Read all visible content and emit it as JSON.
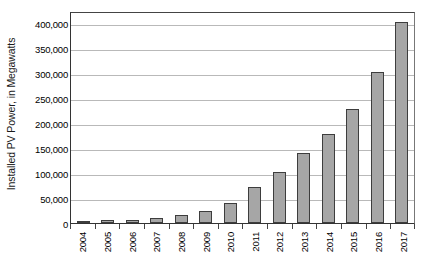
{
  "chart_data": {
    "type": "bar",
    "title": "",
    "xlabel": "",
    "ylabel": "Installed PV Power, in Megawatts",
    "categories": [
      "2004",
      "2005",
      "2006",
      "2007",
      "2008",
      "2009",
      "2010",
      "2011",
      "2012",
      "2013",
      "2014",
      "2015",
      "2016",
      "2017"
    ],
    "values": [
      3700,
      5100,
      7000,
      9500,
      16000,
      24000,
      41000,
      72000,
      103000,
      140000,
      178000,
      229000,
      303000,
      402000
    ],
    "series": [
      {
        "name": "Installed PV Power",
        "values": [
          3700,
          5100,
          7000,
          9500,
          16000,
          24000,
          41000,
          72000,
          103000,
          140000,
          178000,
          229000,
          303000,
          402000
        ]
      }
    ],
    "ylim": [
      0,
      425000
    ],
    "yticks": [
      0,
      50000,
      100000,
      150000,
      200000,
      250000,
      300000,
      350000,
      400000
    ],
    "ytick_labels": [
      "0",
      "50,000",
      "100,000",
      "150,000",
      "200,000",
      "250,000",
      "300,000",
      "350,000",
      "400,000"
    ],
    "grid": true,
    "legend": false,
    "legend_position": "none",
    "bar_color": "#a6a6a6",
    "bar_border_color": "#3d3d3d",
    "gridline_color": "#b9b9b9",
    "axis_color": "#333333",
    "background_color": "#ffffff"
  }
}
